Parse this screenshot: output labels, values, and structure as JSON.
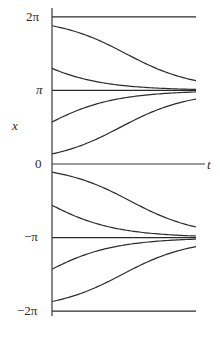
{
  "chart_data": {
    "type": "line",
    "title": "",
    "xlabel": "t",
    "ylabel": "x",
    "ytick_labels": [
      "2π",
      "π",
      "0",
      "−π",
      "−2π"
    ],
    "ytick_values": [
      6.2832,
      3.1416,
      0,
      -3.1416,
      -6.2832
    ],
    "xlim": [
      0,
      3.2
    ],
    "ylim": [
      -6.2832,
      6.2832
    ],
    "grid": false,
    "legend": null,
    "equilibria": [
      6.2832,
      3.1416,
      0,
      -3.1416,
      -6.2832
    ],
    "initial_conditions": [
      5.9,
      4.08,
      1.79,
      0.43,
      -0.35,
      -1.76,
      -4.49,
      -5.87
    ],
    "series": [
      {
        "name": "x0=5.90",
        "t": [
          0,
          0.8,
          1.6,
          2.4,
          3.2
        ],
        "x": [
          5.9,
          5.41,
          4.38,
          3.73,
          3.41
        ]
      },
      {
        "name": "x0=4.08",
        "t": [
          0,
          0.8,
          1.6,
          2.4,
          3.2
        ],
        "x": [
          4.08,
          3.63,
          3.37,
          3.25,
          3.19
        ]
      },
      {
        "name": "x0=1.79",
        "t": [
          0,
          0.8,
          1.6,
          2.4,
          3.2
        ],
        "x": [
          1.79,
          2.5,
          2.87,
          3.02,
          3.09
        ]
      },
      {
        "name": "x0=0.43",
        "t": [
          0,
          0.8,
          1.6,
          2.4,
          3.2
        ],
        "x": [
          0.43,
          0.92,
          1.74,
          2.52,
          2.92
        ]
      },
      {
        "name": "x0=-0.35",
        "t": [
          0,
          0.8,
          1.6,
          2.4,
          3.2
        ],
        "x": [
          -0.35,
          -0.76,
          -1.51,
          -2.35,
          -2.85
        ]
      },
      {
        "name": "x0=-1.76",
        "t": [
          0,
          0.8,
          1.6,
          2.4,
          3.2
        ],
        "x": [
          -1.76,
          -2.48,
          -2.86,
          -3.02,
          -3.09
        ]
      },
      {
        "name": "x0=-4.49",
        "t": [
          0,
          0.8,
          1.6,
          2.4,
          3.2
        ],
        "x": [
          -4.49,
          -3.76,
          -3.4,
          -3.25,
          -3.19
        ]
      },
      {
        "name": "x0=-5.87",
        "t": [
          0,
          0.8,
          1.6,
          2.4,
          3.2
        ],
        "x": [
          -5.87,
          -5.32,
          -4.27,
          -3.67,
          -3.38
        ]
      }
    ]
  },
  "labels": {
    "y_axis": "x",
    "x_axis": "t",
    "tick_2pi": "2π",
    "tick_pi": "π",
    "tick_0": "0",
    "tick_neg_pi": "−π",
    "tick_neg_2pi": "−2π"
  },
  "style": {
    "line_color": "#2b2b2b",
    "axis_color": "#3a3a3a",
    "background": "#ffffff"
  }
}
